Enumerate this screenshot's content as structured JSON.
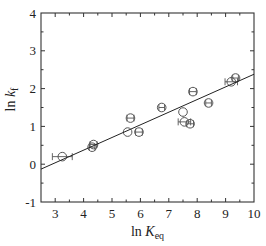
{
  "chart_data": {
    "type": "scatter",
    "title": "",
    "xlabel": "ln K_eq",
    "ylabel": "ln k_f",
    "xlabel_parts": {
      "main": "ln ",
      "var": "K",
      "sub": "eq"
    },
    "ylabel_parts": {
      "main": "ln ",
      "var": "k",
      "sub": "f"
    },
    "xlim": [
      2.5,
      10
    ],
    "ylim": [
      -1,
      4
    ],
    "x_ticks": [
      3,
      4,
      5,
      6,
      7,
      8,
      9,
      10
    ],
    "y_ticks": [
      -1,
      0,
      1,
      2,
      3,
      4
    ],
    "x_tick_labels": [
      "3",
      "4",
      "5",
      "6",
      "7",
      "8",
      "9",
      "10"
    ],
    "y_tick_labels": [
      "-1",
      "0",
      "1",
      "2",
      "3",
      "4"
    ],
    "grid": false,
    "legend": null,
    "marker": "open-circle",
    "series": [
      {
        "name": "data",
        "points": [
          {
            "x": 3.25,
            "y": 0.2,
            "xerr": 0.35
          },
          {
            "x": 4.35,
            "y": 0.52,
            "xerr": 0.12
          },
          {
            "x": 4.3,
            "y": 0.45,
            "xerr": 0.1
          },
          {
            "x": 5.55,
            "y": 0.85,
            "xerr": 0.0
          },
          {
            "x": 5.95,
            "y": 0.85,
            "xerr": 0.12
          },
          {
            "x": 5.65,
            "y": 1.22,
            "xerr": 0.12
          },
          {
            "x": 6.75,
            "y": 1.5,
            "xerr": 0.1
          },
          {
            "x": 7.5,
            "y": 1.38,
            "xerr": 0.0
          },
          {
            "x": 7.55,
            "y": 1.12,
            "xerr": 0.22
          },
          {
            "x": 7.75,
            "y": 1.07,
            "xerr": 0.12
          },
          {
            "x": 7.85,
            "y": 1.92,
            "xerr": 0.12
          },
          {
            "x": 8.4,
            "y": 1.62,
            "xerr": 0.1
          },
          {
            "x": 9.2,
            "y": 2.18,
            "xerr": 0.22
          },
          {
            "x": 9.35,
            "y": 2.28,
            "xerr": 0.1
          }
        ]
      }
    ],
    "fit_line": {
      "x": [
        2.5,
        10
      ],
      "y": [
        -0.13,
        2.38
      ]
    }
  }
}
